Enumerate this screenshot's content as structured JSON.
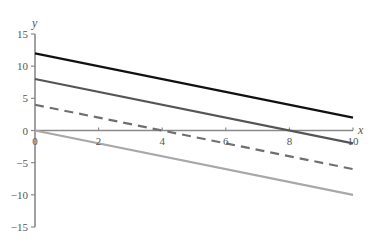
{
  "chart_data": {
    "type": "line",
    "title": "",
    "xlabel": "x",
    "ylabel": "y",
    "xlim": [
      0,
      10
    ],
    "ylim": [
      -15,
      15
    ],
    "grid": false,
    "legend": null,
    "x_ticks": [
      0,
      2,
      4,
      6,
      8,
      10
    ],
    "x_tick_labels": [
      "0",
      "2",
      "4",
      "6",
      "8",
      "10"
    ],
    "y_ticks": [
      15,
      10,
      5,
      0,
      -5,
      -10,
      -15
    ],
    "y_tick_labels": [
      "15",
      "10",
      "5",
      "0",
      "−5",
      "−10",
      "−15"
    ],
    "x": [
      0,
      10
    ],
    "series": [
      {
        "name": "y = 12 − x",
        "values": [
          12,
          2
        ],
        "color": "#111111",
        "style": "solid",
        "width": 2.2
      },
      {
        "name": "y = 8 − x",
        "values": [
          8,
          -2
        ],
        "color": "#555555",
        "style": "solid",
        "width": 2.2
      },
      {
        "name": "y = 4 − x",
        "values": [
          4,
          -6
        ],
        "color": "#6f6f6f",
        "style": "dashed",
        "width": 2.2
      },
      {
        "name": "y = −x",
        "values": [
          0,
          -10
        ],
        "color": "#a8a8a8",
        "style": "solid",
        "width": 2.2
      }
    ]
  },
  "colors": {
    "axis": "#8a8a8a",
    "text": "#555555",
    "background": "#ffffff"
  }
}
